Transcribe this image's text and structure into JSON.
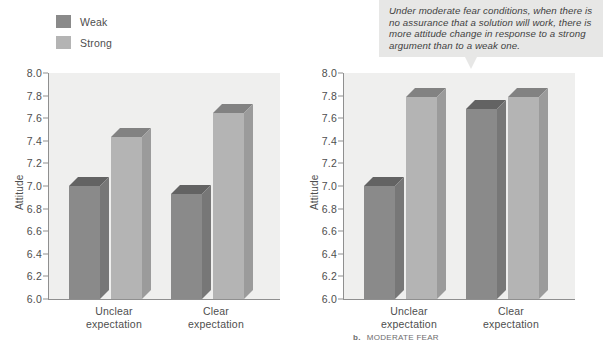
{
  "legend": {
    "items": [
      {
        "label": "Weak",
        "color": "#8a8a8a"
      },
      {
        "label": "Strong",
        "color": "#b4b4b4"
      }
    ]
  },
  "charts": [
    {
      "id": "left-chart",
      "ylabel": "Attitude",
      "yticks": [
        "8.0",
        "7.8",
        "7.6",
        "7.4",
        "7.2",
        "7.0",
        "6.8",
        "6.6",
        "6.4",
        "6.2",
        "6.0"
      ],
      "categories": [
        "Unclear\nexpectation",
        "Clear\nexpectation"
      ],
      "category_lines": [
        [
          "Unclear",
          "expectation"
        ],
        [
          "Clear",
          "expectation"
        ]
      ],
      "footnote_marker": "",
      "footnote_text": ""
    },
    {
      "id": "right-chart",
      "ylabel": "Attitude",
      "yticks": [
        "8.0",
        "7.8",
        "7.6",
        "7.4",
        "7.2",
        "7.0",
        "6.8",
        "6.6",
        "6.4",
        "6.2",
        "6.0"
      ],
      "categories": [
        "Unclear\nexpectation",
        "Clear\nexpectation"
      ],
      "category_lines": [
        [
          "Unclear",
          "expectation"
        ],
        [
          "Clear",
          "expectation"
        ]
      ],
      "footnote_marker": "b.",
      "footnote_text": "MODERATE FEAR"
    }
  ],
  "callout": {
    "text": "Under moderate fear conditions, when there is no assurance that a solution will work, there is more attitude change in response to a strong argument than to a weak one.",
    "background": "#e7e7e6"
  },
  "chart_data": [
    {
      "type": "bar",
      "title": "",
      "id": "left-chart",
      "xlabel": "",
      "ylabel": "Attitude",
      "ylim": [
        6.0,
        8.0
      ],
      "ytick_step": 0.2,
      "grid": false,
      "legend_position": "top-left",
      "categories": [
        "Unclear expectation",
        "Clear expectation"
      ],
      "series": [
        {
          "name": "Weak",
          "color": "#8a8a8a",
          "values": [
            7.0,
            6.93
          ]
        },
        {
          "name": "Strong",
          "color": "#b4b4b4",
          "values": [
            7.43,
            7.65
          ]
        }
      ]
    },
    {
      "type": "bar",
      "title": "",
      "id": "right-chart",
      "xlabel": "",
      "ylabel": "Attitude",
      "ylim": [
        6.0,
        8.0
      ],
      "ytick_step": 0.2,
      "grid": false,
      "legend_position": "none",
      "categories": [
        "Unclear expectation",
        "Clear expectation"
      ],
      "series": [
        {
          "name": "Weak",
          "color": "#8a8a8a",
          "values": [
            7.0,
            7.68
          ]
        },
        {
          "name": "Strong",
          "color": "#b4b4b4",
          "values": [
            7.79,
            7.79
          ]
        }
      ]
    }
  ]
}
